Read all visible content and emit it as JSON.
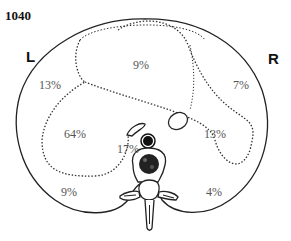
{
  "figure": {
    "number": "1040",
    "left_label": "L",
    "right_label": "R"
  },
  "regions": [
    {
      "id": "left-upper",
      "label": "13%"
    },
    {
      "id": "top-center",
      "label": "9%"
    },
    {
      "id": "right-upper",
      "label": "7%"
    },
    {
      "id": "left-middle",
      "label": "64%"
    },
    {
      "id": "right-middle",
      "label": "13%"
    },
    {
      "id": "center-aortic",
      "label": "17%"
    },
    {
      "id": "left-lower",
      "label": "9%"
    },
    {
      "id": "right-lower",
      "label": "4%"
    }
  ]
}
